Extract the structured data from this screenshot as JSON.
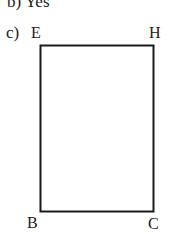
{
  "prev_answer": "b) Yes",
  "part_label": "c)",
  "figure": {
    "type": "rectangle",
    "vertices": {
      "top_left": "E",
      "top_right": "H",
      "bottom_left": "B",
      "bottom_right": "C"
    },
    "stroke_color": "#1a1a1a"
  }
}
